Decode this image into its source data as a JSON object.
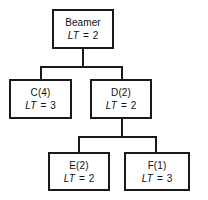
{
  "diagram": {
    "metric_label": "LT",
    "equals": "=",
    "nodes": [
      {
        "id": "beamer",
        "name": "Beamer",
        "metric_value": "2",
        "level": 0,
        "x": 52,
        "y": 9,
        "w": 62,
        "h": 40
      },
      {
        "id": "c",
        "name": "C(4)",
        "metric_value": "3",
        "level": 1,
        "x": 9,
        "y": 79,
        "w": 63,
        "h": 40
      },
      {
        "id": "d",
        "name": "D(2)",
        "metric_value": "2",
        "level": 1,
        "x": 90,
        "y": 79,
        "w": 62,
        "h": 40
      },
      {
        "id": "e",
        "name": "E(2)",
        "metric_value": "2",
        "level": 2,
        "x": 48,
        "y": 152,
        "w": 62,
        "h": 39
      },
      {
        "id": "f",
        "name": "F(1)",
        "metric_value": "3",
        "level": 2,
        "x": 124,
        "y": 152,
        "w": 66,
        "h": 39
      }
    ],
    "connectors": [
      {
        "id": "beamer-stem",
        "type": "v",
        "x": 82,
        "y": 49,
        "len": 18
      },
      {
        "id": "level1-bus",
        "type": "h",
        "x": 40,
        "y": 66,
        "len": 83
      },
      {
        "id": "c-stem",
        "type": "v",
        "x": 40,
        "y": 66,
        "len": 14
      },
      {
        "id": "d-stem",
        "type": "v",
        "x": 121,
        "y": 66,
        "len": 14
      },
      {
        "id": "d-down-stem",
        "type": "v",
        "x": 121,
        "y": 119,
        "len": 17
      },
      {
        "id": "level2-bus",
        "type": "h",
        "x": 78,
        "y": 136,
        "len": 79
      },
      {
        "id": "e-stem",
        "type": "v",
        "x": 78,
        "y": 136,
        "len": 17
      },
      {
        "id": "f-stem",
        "type": "v",
        "x": 155,
        "y": 136,
        "len": 17
      }
    ]
  },
  "colors": {
    "line": "#1a1a1a",
    "text": "#111111",
    "background": "#ffffff"
  }
}
